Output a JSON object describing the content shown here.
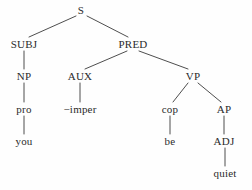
{
  "figure": {
    "kind": "syntax-tree",
    "background_color": "#fefefe",
    "line_color": "#3a3a3a",
    "text_color": "#2b2b2b",
    "sentence": "you be quiet"
  },
  "nodes": {
    "s": {
      "label": "S",
      "x": 81,
      "y": 10,
      "type": "category"
    },
    "subj": {
      "label": "SUBJ",
      "x": 24,
      "y": 44,
      "type": "category"
    },
    "pred": {
      "label": "PRED",
      "x": 133,
      "y": 44,
      "type": "category"
    },
    "np": {
      "label": "NP",
      "x": 24,
      "y": 76,
      "type": "category"
    },
    "aux": {
      "label": "AUX",
      "x": 80,
      "y": 76,
      "type": "category"
    },
    "vp": {
      "label": "VP",
      "x": 193,
      "y": 76,
      "type": "category"
    },
    "pro": {
      "label": "pro",
      "x": 24,
      "y": 109,
      "type": "terminal"
    },
    "imper": {
      "label": "−imper",
      "x": 80,
      "y": 109,
      "type": "terminal"
    },
    "cop": {
      "label": "cop",
      "x": 170,
      "y": 109,
      "type": "terminal"
    },
    "ap": {
      "label": "AP",
      "x": 224,
      "y": 109,
      "type": "category"
    },
    "you": {
      "label": "you",
      "x": 24,
      "y": 141,
      "type": "terminal"
    },
    "be": {
      "label": "be",
      "x": 170,
      "y": 141,
      "type": "terminal"
    },
    "adj": {
      "label": "ADJ",
      "x": 224,
      "y": 141,
      "type": "category"
    },
    "quiet": {
      "label": "quiet",
      "x": 225,
      "y": 173,
      "type": "terminal"
    }
  },
  "edges": [
    {
      "name": "s-to-subj",
      "from": "s",
      "to": "subj",
      "x1": 76,
      "y1": 16,
      "x2": 29,
      "y2": 37
    },
    {
      "name": "s-to-pred",
      "from": "s",
      "to": "pred",
      "x1": 87,
      "y1": 16,
      "x2": 128,
      "y2": 37
    },
    {
      "name": "subj-to-np",
      "from": "subj",
      "to": "np",
      "x1": 24,
      "y1": 51,
      "x2": 24,
      "y2": 69
    },
    {
      "name": "pred-to-aux",
      "from": "pred",
      "to": "aux",
      "x1": 127,
      "y1": 51,
      "x2": 85,
      "y2": 69
    },
    {
      "name": "pred-to-vp",
      "from": "pred",
      "to": "vp",
      "x1": 139,
      "y1": 51,
      "x2": 188,
      "y2": 69
    },
    {
      "name": "np-to-pro",
      "from": "np",
      "to": "pro",
      "x1": 24,
      "y1": 83,
      "x2": 24,
      "y2": 102
    },
    {
      "name": "aux-to-imper",
      "from": "aux",
      "to": "imper",
      "x1": 80,
      "y1": 83,
      "x2": 80,
      "y2": 102
    },
    {
      "name": "vp-to-cop",
      "from": "vp",
      "to": "cop",
      "x1": 188,
      "y1": 83,
      "x2": 173,
      "y2": 102
    },
    {
      "name": "vp-to-ap",
      "from": "vp",
      "to": "ap",
      "x1": 198,
      "y1": 83,
      "x2": 221,
      "y2": 102
    },
    {
      "name": "pro-to-you",
      "from": "pro",
      "to": "you",
      "x1": 24,
      "y1": 116,
      "x2": 24,
      "y2": 134
    },
    {
      "name": "cop-to-be",
      "from": "cop",
      "to": "be",
      "x1": 170,
      "y1": 116,
      "x2": 170,
      "y2": 134
    },
    {
      "name": "ap-to-adj",
      "from": "ap",
      "to": "adj",
      "x1": 224,
      "y1": 116,
      "x2": 224,
      "y2": 134
    },
    {
      "name": "adj-to-quiet",
      "from": "adj",
      "to": "quiet",
      "x1": 225,
      "y1": 148,
      "x2": 225,
      "y2": 166
    }
  ]
}
